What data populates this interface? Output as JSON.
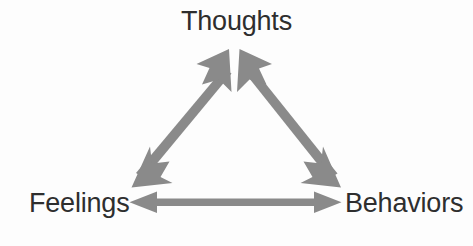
{
  "diagram": {
    "name": "cognitive-behavioral-triangle",
    "background_color": "#fdfdfd",
    "arrow_color": "#8a8a8a",
    "label_color": "#2e2e2e",
    "nodes": [
      {
        "id": "thoughts",
        "label": "Thoughts",
        "position": "top"
      },
      {
        "id": "feelings",
        "label": "Feelings",
        "position": "bottom-left"
      },
      {
        "id": "behaviors",
        "label": "Behaviors",
        "position": "bottom-right"
      }
    ],
    "connections": [
      {
        "id": "thoughts-feelings",
        "from": "thoughts",
        "to": "feelings",
        "style": "double-headed-arrow"
      },
      {
        "id": "thoughts-behaviors",
        "from": "thoughts",
        "to": "behaviors",
        "style": "double-headed-arrow"
      },
      {
        "id": "feelings-behaviors",
        "from": "feelings",
        "to": "behaviors",
        "style": "double-headed-arrow"
      }
    ]
  }
}
